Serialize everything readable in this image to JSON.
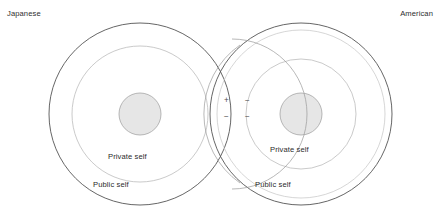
{
  "figure": {
    "type": "venn-overlap-concentric-circles",
    "width": 441,
    "height": 216,
    "background_color": "#ffffff"
  },
  "labels": {
    "culture_left": "Japanese",
    "culture_right": "American",
    "private_self_left": "Private self",
    "public_self_left": "Public self",
    "private_self_right": "Private self",
    "public_self_right": "Public self"
  },
  "overlap_signs": {
    "top_left": "+",
    "top_right": "−",
    "bottom_left": "−",
    "bottom_right": "−"
  },
  "colors": {
    "outer_circle_stroke": "#555555",
    "middle_circle_stroke": "#b9b9b9",
    "inner_circle_stroke": "#a6a6a6",
    "inner_circle_fill": "#e6e6e6",
    "text": "#2e2e2e",
    "sign_text": "#4a4a4a"
  },
  "geometry": {
    "left_group": {
      "center_x": 140,
      "center_y": 114,
      "outer_radius": 91,
      "middle_radius": 68,
      "inner_radius": 21
    },
    "right_group": {
      "center_x": 301,
      "center_y": 114,
      "outer_radius": 91,
      "middle_radius": 55,
      "inner_radius": 21
    }
  }
}
